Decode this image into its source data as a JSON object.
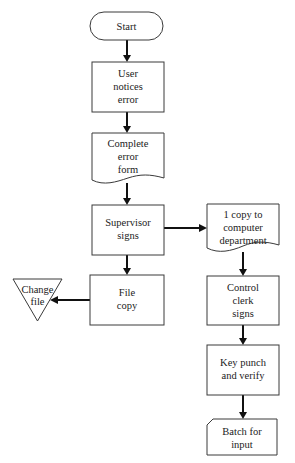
{
  "diagram": {
    "type": "flowchart",
    "colors": {
      "stroke": "#3a3a3a",
      "arrow": "#111111",
      "text": "#222222",
      "background": "#ffffff"
    },
    "nodes": [
      {
        "id": "start",
        "shape": "terminator",
        "lines": [
          "Start"
        ]
      },
      {
        "id": "user-notices",
        "shape": "process",
        "lines": [
          "User",
          "notices",
          "error"
        ]
      },
      {
        "id": "complete-form",
        "shape": "document",
        "lines": [
          "Complete",
          "error",
          "form"
        ]
      },
      {
        "id": "supervisor",
        "shape": "process",
        "lines": [
          "Supervisor",
          "signs"
        ]
      },
      {
        "id": "file-copy",
        "shape": "process",
        "lines": [
          "File",
          "copy"
        ]
      },
      {
        "id": "change-file",
        "shape": "offline-storage",
        "lines": [
          "Change",
          "file"
        ]
      },
      {
        "id": "copy-computer",
        "shape": "document",
        "lines": [
          "1 copy to",
          "computer",
          "department"
        ]
      },
      {
        "id": "control-clerk",
        "shape": "process",
        "lines": [
          "Control",
          "clerk",
          "signs"
        ]
      },
      {
        "id": "key-punch",
        "shape": "process",
        "lines": [
          "Key punch",
          "and verify"
        ]
      },
      {
        "id": "batch",
        "shape": "card",
        "lines": [
          "Batch for",
          "input"
        ]
      }
    ],
    "edges": [
      {
        "from": "start",
        "to": "user-notices"
      },
      {
        "from": "user-notices",
        "to": "complete-form"
      },
      {
        "from": "complete-form",
        "to": "supervisor"
      },
      {
        "from": "supervisor",
        "to": "copy-computer"
      },
      {
        "from": "supervisor",
        "to": "file-copy"
      },
      {
        "from": "file-copy",
        "to": "change-file"
      },
      {
        "from": "copy-computer",
        "to": "control-clerk"
      },
      {
        "from": "control-clerk",
        "to": "key-punch"
      },
      {
        "from": "key-punch",
        "to": "batch"
      }
    ]
  }
}
